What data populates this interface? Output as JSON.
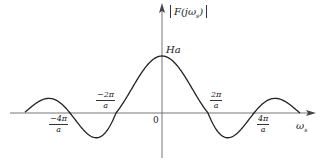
{
  "diagram": {
    "y_axis_label": "|F(jω_s)|",
    "y_axis_label_main": "F(jω",
    "y_axis_label_sub": "s",
    "y_axis_label_close": ")",
    "x_axis_label_main": "ω",
    "x_axis_label_sub": "s",
    "origin_label": "0",
    "peak_label": "Ha",
    "ticks": [
      {
        "num": "−4π",
        "den": "a"
      },
      {
        "num": "−2π",
        "den": "a"
      },
      {
        "num": "2π",
        "den": "a"
      },
      {
        "num": "4π",
        "den": "a"
      }
    ],
    "curve": "sinc-shaped spectrum magnitude: F(ω_s) = Ha·sin(ω_s a/2)/(ω_s a/2)",
    "colors": {
      "line": "#222222",
      "axis": "#555555"
    }
  }
}
